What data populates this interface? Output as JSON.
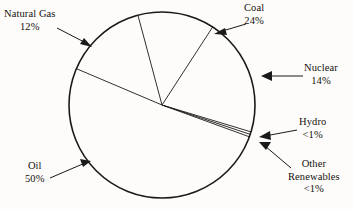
{
  "chart_data": {
    "type": "pie",
    "title": "",
    "subtitle": "",
    "xlabel": "",
    "ylabel": "",
    "legend_position": "callout-labels",
    "grid": false,
    "categories": [
      "Coal",
      "Natural Gas",
      "Oil",
      "Hydro",
      "Other Renewables",
      "Nuclear"
    ],
    "values": [
      24,
      12,
      50,
      0.5,
      0.5,
      14
    ],
    "value_labels": [
      "24%",
      "12%",
      "50%",
      "<1%",
      "<1%",
      "14%"
    ],
    "slices": [
      {
        "name": "Coal",
        "value": 24,
        "value_label": "24%",
        "start_angle": -105,
        "end_angle": -57,
        "fill": "#fdfcfa",
        "stroke": "#1a1a1a"
      },
      {
        "name": "Natural Gas",
        "value": 12,
        "value_label": "12%",
        "start_angle": -157,
        "end_angle": -105,
        "fill": "#fdfcfa",
        "stroke": "#1a1a1a"
      },
      {
        "name": "Oil",
        "value": 50,
        "value_label": "50%",
        "start_angle": -157,
        "end_angle": 20,
        "fill": "#fdfcfa",
        "stroke": "#1a1a1a"
      },
      {
        "name": "Hydro",
        "value": 0.5,
        "value_label": "<1%",
        "start_angle": 18.4,
        "end_angle": 20,
        "fill": "#fdfcfa",
        "stroke": "#1a1a1a"
      },
      {
        "name": "Other Renewables",
        "value": 0.5,
        "value_label": "<1%",
        "start_angle": 16.8,
        "end_angle": 18.4,
        "fill": "#fdfcfa",
        "stroke": "#1a1a1a"
      },
      {
        "name": "Nuclear",
        "value": 14,
        "value_label": "14%",
        "start_angle": -57,
        "end_angle": 16.8,
        "fill": "#fdfcfa",
        "stroke": "#1a1a1a"
      }
    ]
  },
  "labels": {
    "natural_gas": {
      "name": "Natural Gas",
      "pct": "12%"
    },
    "coal": {
      "name": "Coal",
      "pct": "24%"
    },
    "nuclear": {
      "name": "Nuclear",
      "pct": "14%"
    },
    "hydro": {
      "name": "Hydro",
      "pct": "<1%"
    },
    "other_renewables": {
      "name_line1": "Other",
      "name_line2": "Renewables",
      "pct": "<1%"
    },
    "oil": {
      "name": "Oil",
      "pct": "50%"
    }
  },
  "style": {
    "background": "#fdfcfa",
    "line_color": "#1a1a1a",
    "text_color": "#15110e"
  }
}
